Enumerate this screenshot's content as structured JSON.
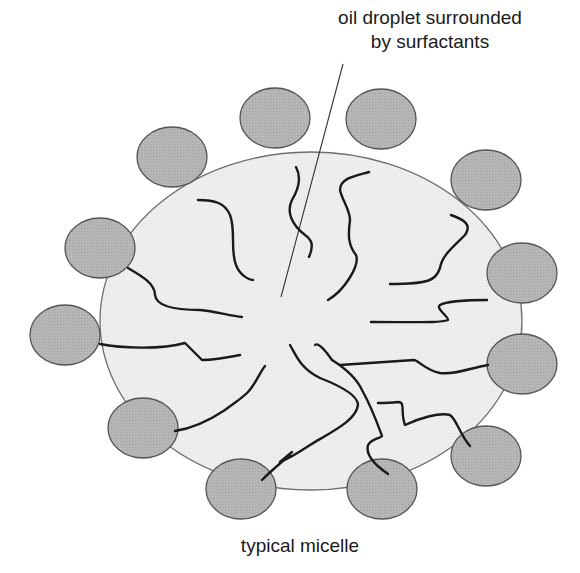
{
  "diagram": {
    "title_callout": {
      "line1": "oil droplet surrounded",
      "line2": "by surfactants"
    },
    "caption": "typical micelle",
    "colors": {
      "background": "#ffffff",
      "oil_droplet_fill": "#ededed",
      "oil_droplet_stroke": "#6e6e6e",
      "head_fill": "#b4b4b4",
      "head_stroke": "#555555",
      "tail_stroke": "#1a1a1a",
      "leader_line": "#333333",
      "text": "#1a1a1a"
    },
    "components": [
      {
        "name": "oil droplet",
        "shape": "ellipse"
      },
      {
        "name": "surfactant heads",
        "count": 12,
        "shape": "circle"
      },
      {
        "name": "hydrophobic tails",
        "shape": "wavy line"
      }
    ]
  }
}
